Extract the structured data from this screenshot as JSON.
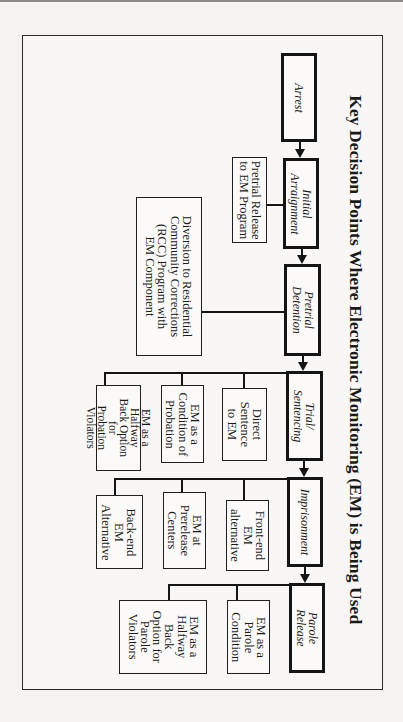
{
  "title": "Key Decision Points Where Electronic Monitoring (EM) is Being Used",
  "orientation": "page rotated 90 degrees clockwise",
  "stages": [
    {
      "id": "arrest",
      "label": "Arrest"
    },
    {
      "id": "initial-arraignment",
      "label": "Initial Arraignment",
      "lines": [
        "Initial",
        "Arraignment"
      ]
    },
    {
      "id": "pretrial-detention",
      "label": "Pretrial Detention",
      "lines": [
        "Pretrial",
        "Detention"
      ]
    },
    {
      "id": "trial-sentencing",
      "label": "Trial/ Sentencing",
      "lines": [
        "Trial/",
        "Sentencing"
      ]
    },
    {
      "id": "imprisonment",
      "label": "Imprisonment"
    },
    {
      "id": "parole-release",
      "label": "Parole Release",
      "lines": [
        "Parole",
        "Release"
      ]
    }
  ],
  "options": {
    "initial_arraignment": [
      {
        "label": "Pretrial Release to EM Program",
        "lines": [
          "Pretrial Release",
          "to EM Program"
        ]
      }
    ],
    "pretrial_detention": [
      {
        "label": "Diversion to Residential Community Corrections (RCC) Program with EM Component",
        "lines": [
          "Diversion to Residential",
          "Community Corrections",
          "(RCC) Program with",
          "EM Component"
        ]
      }
    ],
    "trial_sentencing": [
      {
        "label": "Direct Sentence to EM",
        "lines": [
          "Direct",
          "Sentence",
          "to EM"
        ]
      },
      {
        "label": "EM as a Condition of Probation",
        "lines": [
          "EM as a",
          "Condition of",
          "Probation"
        ]
      },
      {
        "label": "EM as a Halfway Back Option for Probation Violators",
        "lines": [
          "EM as a",
          "Halfway",
          "Back Option",
          "for",
          "Probation",
          "Violators"
        ]
      }
    ],
    "imprisonment": [
      {
        "label": "Front-end EM alternative",
        "lines": [
          "Front-end",
          "EM",
          "alternative"
        ]
      },
      {
        "label": "EM at Prerelease Centers",
        "lines": [
          "EM at",
          "Prerelease",
          "Centers"
        ]
      },
      {
        "label": "Back-end EM Alternative",
        "lines": [
          "Back-end",
          "EM",
          "Alternative"
        ]
      }
    ],
    "parole_release": [
      {
        "label": "EM as a Parole Condition",
        "lines": [
          "EM as a",
          "Parole",
          "Condition"
        ]
      },
      {
        "label": "EM as a Halfway Back Option for Parole Violators",
        "lines": [
          "EM as a",
          "Halfway",
          "Back",
          "Option for",
          "Parole",
          "Violators"
        ]
      }
    ]
  },
  "edges": [
    [
      "Arrest",
      "Initial Arraignment"
    ],
    [
      "Initial Arraignment",
      "Pretrial Detention"
    ],
    [
      "Pretrial Detention",
      "Trial/ Sentencing"
    ],
    [
      "Trial/ Sentencing",
      "Imprisonment"
    ],
    [
      "Imprisonment",
      "Parole Release"
    ],
    [
      "Initial Arraignment",
      "Pretrial Release to EM Program"
    ],
    [
      "Pretrial Detention",
      "Diversion to Residential Community Corrections (RCC) Program with EM Component"
    ],
    [
      "Trial/ Sentencing",
      "Direct Sentence to EM"
    ],
    [
      "Trial/ Sentencing",
      "EM as a Condition of Probation"
    ],
    [
      "Trial/ Sentencing",
      "EM as a Halfway Back Option for Probation Violators"
    ],
    [
      "Imprisonment",
      "Front-end EM alternative"
    ],
    [
      "Imprisonment",
      "EM at Prerelease Centers"
    ],
    [
      "Imprisonment",
      "Back-end EM Alternative"
    ],
    [
      "Parole Release",
      "EM as a Parole Condition"
    ],
    [
      "Parole Release",
      "EM as a Halfway Back Option for Parole Violators"
    ]
  ]
}
